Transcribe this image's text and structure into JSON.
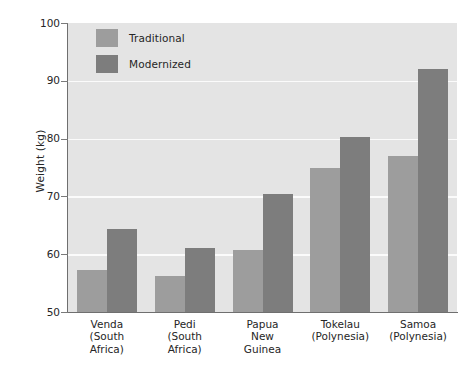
{
  "chart_data": {
    "type": "bar",
    "title": "",
    "xlabel": "",
    "ylabel": "Weight (kg)",
    "ylim": [
      50,
      100
    ],
    "yticks": [
      50,
      60,
      70,
      80,
      90,
      100
    ],
    "grid": true,
    "legend_position": "top-left",
    "categories": [
      "Venda\n(South\nAfrica)",
      "Pedi\n(South\nAfrica)",
      "Papua\nNew\nGuinea",
      "Tokelau\n(Polynesia)",
      "Samoa\n(Polynesia)"
    ],
    "category_lines": [
      [
        "Venda",
        "(South",
        "Africa)"
      ],
      [
        "Pedi",
        "(South",
        "Africa)"
      ],
      [
        "Papua",
        "New",
        "Guinea"
      ],
      [
        "Tokelau",
        "(Polynesia)"
      ],
      [
        "Samoa",
        "(Polynesia)"
      ]
    ],
    "series": [
      {
        "name": "Traditional",
        "color": "#9d9d9d",
        "values": [
          57.2,
          56.3,
          60.8,
          75.0,
          77.0
        ]
      },
      {
        "name": "Modernized",
        "color": "#7d7d7d",
        "values": [
          64.3,
          61.0,
          70.5,
          80.2,
          92.0
        ]
      }
    ]
  },
  "axis": {
    "y_title": "Weight (kg)",
    "y_tick_labels": [
      "100",
      "90",
      "80",
      "70",
      "60",
      "50"
    ]
  },
  "legend": {
    "items": [
      {
        "label": "Traditional",
        "color": "#9d9d9d"
      },
      {
        "label": "Modernized",
        "color": "#7d7d7d"
      }
    ]
  },
  "colors": {
    "plot_background": "#e4e4e4",
    "gridline": "#fbfbfb",
    "axis_line": "#6f6f6f",
    "traditional": "#9d9d9d",
    "modernized": "#7d7d7d",
    "text": "#262626"
  }
}
